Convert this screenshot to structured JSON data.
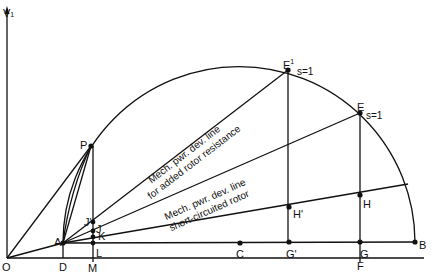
{
  "axis": {
    "vertical_label": "V",
    "vertical_subscript": "1"
  },
  "points": {
    "O": "O",
    "D": "D",
    "M": "M",
    "A": "A",
    "P": "P",
    "J_prime": "J'",
    "J": "J",
    "K": "K",
    "L": "L",
    "C": "C",
    "G_prime": "G'",
    "G": "G",
    "F": "F",
    "B": "B",
    "E_prime": "E",
    "E_prime_sup": "1",
    "E": "E",
    "H_prime": "H'",
    "H": "H"
  },
  "slip_labels": {
    "E_prime": "s=1",
    "E": "s=1"
  },
  "line_labels": {
    "added_resistance_line1": "Mech. pwr. dev. line",
    "added_resistance_line2": "for added rotor resistance",
    "short_circuited_line1": "Mech. pwr. dev. line",
    "short_circuited_line2": "short-circuited rotor"
  },
  "colors": {
    "ink": "#111111",
    "background": "#ffffff"
  }
}
